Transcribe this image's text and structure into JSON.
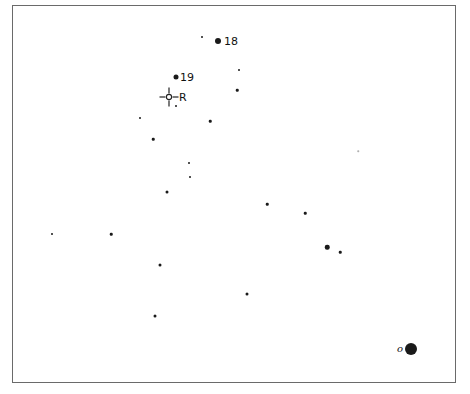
{
  "chart": {
    "frame": {
      "left": 12,
      "top": 5,
      "right": 456,
      "bottom": 383
    },
    "stars": [
      {
        "x": 202,
        "y": 37,
        "size": 2
      },
      {
        "x": 218,
        "y": 41,
        "size": 6,
        "label": "18"
      },
      {
        "x": 239,
        "y": 70,
        "size": 2
      },
      {
        "x": 176,
        "y": 77,
        "size": 5,
        "label": "19"
      },
      {
        "x": 237,
        "y": 90,
        "size": 2.5
      },
      {
        "x": 176,
        "y": 106,
        "size": 2
      },
      {
        "x": 140,
        "y": 118,
        "size": 2
      },
      {
        "x": 210,
        "y": 121,
        "size": 2.5
      },
      {
        "x": 153,
        "y": 139,
        "size": 2.5
      },
      {
        "x": 358,
        "y": 151,
        "size": 1.5,
        "faint": true
      },
      {
        "x": 189,
        "y": 163,
        "size": 2
      },
      {
        "x": 190,
        "y": 177,
        "size": 2
      },
      {
        "x": 167,
        "y": 192,
        "size": 3
      },
      {
        "x": 267,
        "y": 204,
        "size": 2.5
      },
      {
        "x": 305,
        "y": 213,
        "size": 2.5
      },
      {
        "x": 52,
        "y": 234,
        "size": 2
      },
      {
        "x": 111,
        "y": 234,
        "size": 2.5
      },
      {
        "x": 327,
        "y": 247,
        "size": 4.5
      },
      {
        "x": 340,
        "y": 252,
        "size": 2.5
      },
      {
        "x": 160,
        "y": 265,
        "size": 3
      },
      {
        "x": 247,
        "y": 294,
        "size": 3
      },
      {
        "x": 155,
        "y": 316,
        "size": 3
      },
      {
        "x": 411,
        "y": 349,
        "size": 12,
        "label": "o",
        "label_side": "left",
        "label_style": "italic"
      }
    ],
    "reticle": {
      "x": 169,
      "y": 97,
      "label": "R"
    },
    "labels": {
      "star_18": "18",
      "star_19": "19",
      "reticle": "R",
      "object": "o"
    }
  }
}
